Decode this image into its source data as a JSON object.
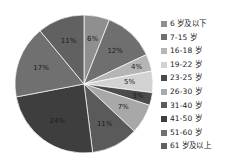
{
  "chart_data": {
    "type": "pie",
    "title": "",
    "legend_position": "right",
    "categories": [
      "6 岁及以下",
      "7-15 岁",
      "16-18 岁",
      "19-22 岁",
      "23-25 岁",
      "26-30 岁",
      "31-40 岁",
      "41-50 岁",
      "51-60 岁",
      "61 岁及以上"
    ],
    "values": [
      6,
      12,
      4,
      5,
      3,
      7,
      11,
      24,
      17,
      11
    ],
    "labels": [
      "6%",
      "12%",
      "4%",
      "5%",
      "3%",
      "7%",
      "11%",
      "24%",
      "17%",
      "11%"
    ],
    "colors": [
      "#8f8f8f",
      "#6f6f6f",
      "#b5b5b5",
      "#d2d2d2",
      "#4b4b4b",
      "#a8a8a8",
      "#5a5a5a",
      "#3e3e3e",
      "#707070",
      "#616161"
    ],
    "total": 100,
    "start_angle_deg": 0,
    "direction": "clockwise"
  }
}
